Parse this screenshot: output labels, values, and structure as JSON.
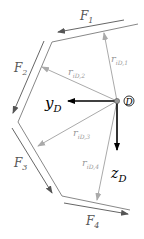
{
  "diagram": {
    "origin_label": "D",
    "axes": {
      "y": {
        "label": "y",
        "sub": "D"
      },
      "z": {
        "label": "z",
        "sub": "D"
      }
    },
    "forces": [
      {
        "label": "F",
        "sub": "1"
      },
      {
        "label": "F",
        "sub": "2"
      },
      {
        "label": "F",
        "sub": "3"
      },
      {
        "label": "F",
        "sub": "4"
      }
    ],
    "vectors": [
      {
        "label": "r",
        "sub": "iD,1"
      },
      {
        "label": "r",
        "sub": "iD,2"
      },
      {
        "label": "r",
        "sub": "iD,3"
      },
      {
        "label": "r",
        "sub": "iD,4"
      }
    ],
    "colors": {
      "axis": "#000000",
      "vector": "#aaaaaa",
      "force": "#555555",
      "boundary": "#777777"
    }
  }
}
